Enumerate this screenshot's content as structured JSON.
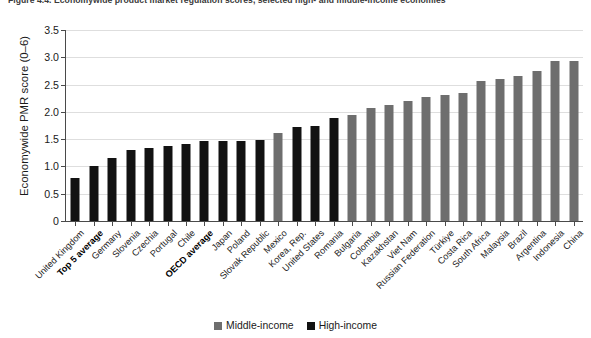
{
  "figure": {
    "title_clipped": "Figure 4.4. Economywide product market regulation scores, selected high- and middle-income economies"
  },
  "legend": {
    "position": "bottom-center",
    "entries": [
      {
        "label": "Middle-income",
        "color": "#6e6e6e",
        "key": "mid"
      },
      {
        "label": "High-income",
        "color": "#121212",
        "key": "high"
      }
    ]
  },
  "chart_data": {
    "type": "bar",
    "title": "",
    "xlabel": "",
    "ylabel": "Economywide PMR score (0–6)",
    "ylim": [
      0,
      3.5
    ],
    "yticks": [
      "0",
      "0.5",
      "1.0",
      "1.5",
      "2.0",
      "2.5",
      "3.0",
      "3.5"
    ],
    "ytick_values": [
      0,
      0.5,
      1.0,
      1.5,
      2.0,
      2.5,
      3.0,
      3.5
    ],
    "grid": "horizontal",
    "categories": [
      "United Kingdom",
      "Top 5 average",
      "Germany",
      "Slovenia",
      "Czechia",
      "Portugal",
      "Chile",
      "OECD average",
      "Japan",
      "Poland",
      "Slovak Republic",
      "Mexico",
      "Korea, Rep.",
      "United States",
      "Romania",
      "Bulgaria",
      "Colombia",
      "Kazakhstan",
      "Viet Nam",
      "Russian Federation",
      "Türkiye",
      "Costa Rica",
      "South Africa",
      "Malaysia",
      "Brazil",
      "Argentina",
      "Indonesia",
      "China"
    ],
    "values": [
      0.78,
      1.01,
      1.15,
      1.3,
      1.33,
      1.37,
      1.42,
      1.46,
      1.46,
      1.47,
      1.48,
      1.62,
      1.72,
      1.74,
      1.88,
      1.94,
      2.07,
      2.13,
      2.2,
      2.27,
      2.31,
      2.35,
      2.57,
      2.61,
      2.66,
      2.74,
      2.93,
      2.94
    ],
    "groups": [
      "high",
      "high",
      "high",
      "high",
      "high",
      "high",
      "high",
      "high",
      "high",
      "high",
      "high",
      "mid",
      "high",
      "high",
      "high",
      "mid",
      "mid",
      "mid",
      "mid",
      "mid",
      "mid",
      "mid",
      "mid",
      "mid",
      "mid",
      "mid",
      "mid",
      "mid"
    ],
    "bold_categories": [
      "Top 5 average",
      "OECD average"
    ],
    "series": [
      {
        "name": "Middle-income",
        "color": "#6e6e6e"
      },
      {
        "name": "High-income",
        "color": "#121212"
      }
    ]
  }
}
